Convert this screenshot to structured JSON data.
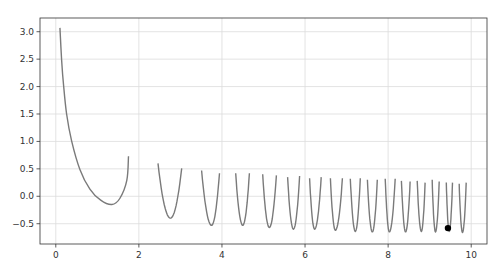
{
  "chart_data": {
    "type": "line",
    "title": "",
    "xlabel": "",
    "ylabel": "",
    "xlim": [
      -0.38,
      10.38
    ],
    "ylim": [
      -0.87,
      3.25
    ],
    "grid": true,
    "legend": null,
    "x_ticks": [
      0,
      2,
      4,
      6,
      8,
      10
    ],
    "x_tick_labels": [
      "0",
      "2",
      "4",
      "6",
      "8",
      "10"
    ],
    "y_ticks": [
      -0.5,
      0.0,
      0.5,
      1.0,
      1.5,
      2.0,
      2.5,
      3.0
    ],
    "y_tick_labels": [
      "−0.5",
      "0.0",
      "0.5",
      "1.0",
      "1.5",
      "2.0",
      "2.5",
      "3.0"
    ],
    "line_color": "#7a7a7a",
    "grid_color": "#dcdcdc",
    "marker_color": "#000000",
    "series": [
      {
        "name": "segments",
        "segments": [
          [
            [
              0.1,
              3.07
            ],
            [
              0.14,
              2.49
            ],
            [
              0.19,
              2.0
            ],
            [
              0.26,
              1.5
            ],
            [
              0.38,
              1.01
            ],
            [
              0.58,
              0.49
            ],
            [
              0.82,
              0.13
            ],
            [
              1.08,
              -0.07
            ],
            [
              1.35,
              -0.15
            ],
            [
              1.54,
              -0.04
            ],
            [
              1.71,
              0.29
            ],
            [
              1.75,
              0.73
            ]
          ],
          [
            [
              2.46,
              0.6
            ],
            [
              2.76,
              -0.4
            ],
            [
              3.03,
              0.51
            ]
          ],
          [
            [
              3.51,
              0.47
            ],
            [
              3.75,
              -0.53
            ],
            [
              3.94,
              0.42
            ]
          ],
          [
            [
              4.33,
              0.42
            ],
            [
              4.5,
              -0.53
            ],
            [
              4.66,
              0.42
            ]
          ],
          [
            [
              4.98,
              0.4
            ],
            [
              5.14,
              -0.57
            ],
            [
              5.31,
              0.38
            ]
          ],
          [
            [
              5.58,
              0.35
            ],
            [
              5.72,
              -0.6
            ],
            [
              5.87,
              0.37
            ]
          ],
          [
            [
              6.11,
              0.33
            ],
            [
              6.23,
              -0.6
            ],
            [
              6.39,
              0.35
            ]
          ],
          [
            [
              6.61,
              0.33
            ],
            [
              6.73,
              -0.62
            ],
            [
              6.9,
              0.33
            ]
          ],
          [
            [
              7.09,
              0.32
            ],
            [
              7.21,
              -0.64
            ],
            [
              7.33,
              0.33
            ]
          ],
          [
            [
              7.5,
              0.3
            ],
            [
              7.62,
              -0.65
            ],
            [
              7.74,
              0.3
            ]
          ],
          [
            [
              7.93,
              0.32
            ],
            [
              8.03,
              -0.65
            ],
            [
              8.17,
              0.32
            ]
          ],
          [
            [
              8.32,
              0.28
            ],
            [
              8.42,
              -0.65
            ],
            [
              8.53,
              0.27
            ]
          ],
          [
            [
              8.7,
              0.28
            ],
            [
              8.8,
              -0.64
            ],
            [
              8.89,
              0.25
            ]
          ],
          [
            [
              9.06,
              0.3
            ],
            [
              9.14,
              -0.65
            ],
            [
              9.23,
              0.27
            ]
          ],
          [
            [
              9.4,
              0.25
            ],
            [
              9.47,
              -0.64
            ],
            [
              9.55,
              0.25
            ]
          ],
          [
            [
              9.71,
              0.23
            ],
            [
              9.79,
              -0.66
            ],
            [
              9.88,
              0.25
            ]
          ]
        ]
      }
    ],
    "markers": [
      {
        "x": 9.44,
        "y": -0.58
      }
    ]
  },
  "layout": {
    "width": 503,
    "height": 275,
    "axes": {
      "left": 40,
      "top": 18,
      "right": 487,
      "bottom": 244
    }
  }
}
